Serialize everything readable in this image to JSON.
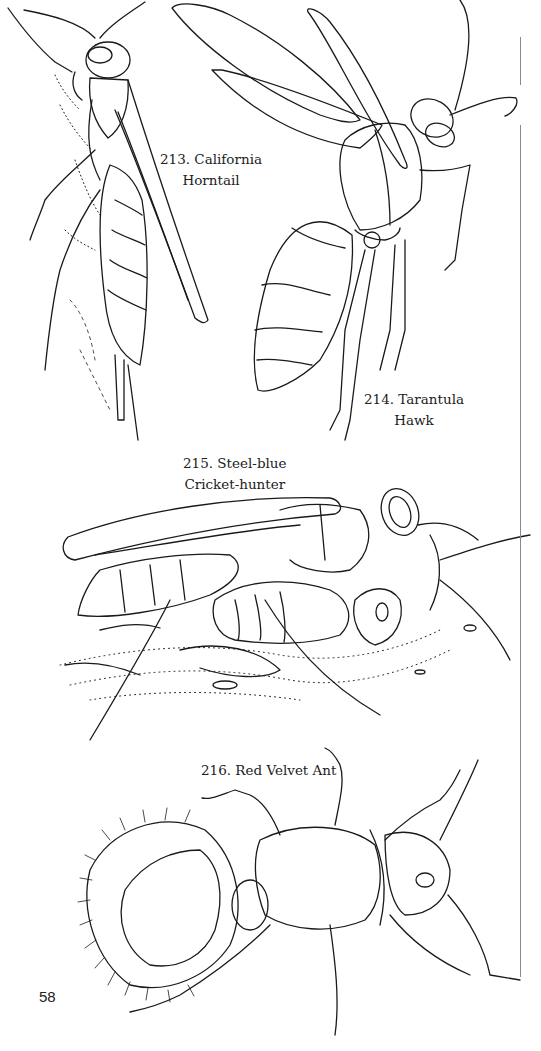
{
  "page": {
    "page_number": "58",
    "background_color": "#ffffff",
    "line_color": "#1a1a1a"
  },
  "illustrations": [
    {
      "number": "213",
      "caption_line1": "213. California",
      "caption_line2": "Horntail",
      "subject": "California Horntail"
    },
    {
      "number": "214",
      "caption_line1": "214. Tarantula",
      "caption_line2": "Hawk",
      "subject": "Tarantula Hawk"
    },
    {
      "number": "215",
      "caption_line1": "215. Steel-blue",
      "caption_line2": "Cricket-hunter",
      "subject": "Steel-blue Cricket-hunter"
    },
    {
      "number": "216",
      "caption_line1": "216. Red Velvet Ant",
      "caption_line2": "",
      "subject": "Red Velvet Ant"
    }
  ]
}
